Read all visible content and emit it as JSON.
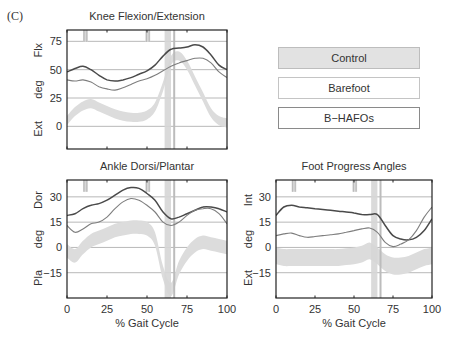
{
  "panel_label": "(C)",
  "legend": {
    "items": [
      {
        "label": "Control",
        "style": "shaded band",
        "color": "#d9d9d9"
      },
      {
        "label": "Barefoot",
        "style": "thin line",
        "color": "#7a7a7a"
      },
      {
        "label": "B−HAFOs",
        "style": "thick line",
        "color": "#444444"
      }
    ]
  },
  "chart_data": [
    {
      "type": "line",
      "title": "Knee Flexion/Extension",
      "xlabel": "",
      "ylabel": [
        "Ext",
        "deg",
        "Flx"
      ],
      "xlim": [
        0,
        100
      ],
      "ylim": [
        -20,
        85
      ],
      "yticks": [
        0,
        25,
        50,
        75
      ],
      "xticks": [
        0,
        25,
        50,
        75,
        100
      ],
      "show_xtick_labels": false,
      "grid": "horizontal",
      "x": [
        0,
        5,
        10,
        15,
        20,
        25,
        30,
        35,
        40,
        45,
        50,
        55,
        60,
        65,
        70,
        75,
        80,
        85,
        90,
        95,
        100
      ],
      "series": [
        {
          "name": "B−HAFOs",
          "values": [
            48,
            51,
            53,
            50,
            45,
            41,
            40,
            41,
            43,
            46,
            49,
            54,
            62,
            68,
            69,
            70,
            72,
            70,
            63,
            54,
            50
          ]
        },
        {
          "name": "Barefoot",
          "values": [
            41,
            40,
            41,
            39,
            35,
            33,
            32,
            34,
            37,
            40,
            42,
            45,
            49,
            53,
            56,
            58,
            60,
            60,
            56,
            48,
            43
          ]
        }
      ],
      "control_band": {
        "mean": [
          5,
          13,
          18,
          20,
          17,
          14,
          11,
          9,
          8,
          8,
          10,
          17,
          35,
          58,
          62,
          54,
          40,
          26,
          12,
          5,
          3
        ],
        "half_width": 4
      },
      "toe_off_band": [
        61,
        65
      ],
      "toe_off_line": 67,
      "event_marks": [
        [
          10,
          13
        ],
        [
          49,
          52
        ]
      ]
    },
    {
      "type": "line",
      "title": "Ankle Dorsi/Plantar",
      "xlabel": "% Gait Cycle",
      "ylabel": [
        "Pla",
        "deg",
        "Dor"
      ],
      "xlim": [
        0,
        100
      ],
      "ylim": [
        -30,
        40
      ],
      "yticks": [
        -15,
        0,
        15,
        30
      ],
      "xticks": [
        0,
        25,
        50,
        75,
        100
      ],
      "show_xtick_labels": true,
      "grid": "horizontal",
      "x": [
        0,
        5,
        10,
        15,
        20,
        25,
        30,
        35,
        40,
        45,
        50,
        55,
        60,
        65,
        70,
        75,
        80,
        85,
        90,
        95,
        100
      ],
      "series": [
        {
          "name": "B−HAFOs",
          "values": [
            19,
            20,
            23,
            25,
            26,
            28,
            31,
            34,
            35.5,
            35,
            32,
            28,
            21,
            17,
            18,
            20,
            22,
            24,
            24,
            23,
            21
          ]
        },
        {
          "name": "Barefoot",
          "values": [
            13,
            9,
            11,
            14,
            15,
            18,
            23,
            27,
            29,
            28,
            25,
            21,
            15,
            13,
            15,
            19,
            22,
            23,
            23,
            20,
            14
          ]
        }
      ],
      "control_band": {
        "mean": [
          -2,
          -5,
          0,
          4,
          6,
          8,
          10,
          11,
          12,
          12,
          11,
          5,
          -15,
          -25,
          -12,
          -4,
          1,
          3,
          2,
          1,
          0
        ],
        "half_width": 4
      },
      "toe_off_band": [
        61,
        65
      ],
      "toe_off_line": 67,
      "event_marks": [
        [
          10,
          13
        ],
        [
          49,
          52
        ]
      ]
    },
    {
      "type": "line",
      "title": "Foot Progress Angles",
      "xlabel": "% Gait Cycle",
      "ylabel": [
        "Ext",
        "deg",
        "Int"
      ],
      "xlim": [
        0,
        100
      ],
      "ylim": [
        -30,
        40
      ],
      "yticks": [
        -15,
        0,
        15,
        30
      ],
      "xticks": [
        0,
        25,
        50,
        75,
        100
      ],
      "show_xtick_labels": true,
      "grid": "horizontal",
      "x": [
        0,
        5,
        10,
        15,
        20,
        25,
        30,
        35,
        40,
        45,
        50,
        55,
        60,
        65,
        70,
        75,
        80,
        85,
        90,
        95,
        100
      ],
      "series": [
        {
          "name": "B−HAFOs",
          "values": [
            19,
            24,
            25,
            24,
            23.5,
            23,
            22.5,
            22,
            21.5,
            21,
            20.5,
            19.5,
            19.5,
            19.5,
            13,
            7,
            5,
            4.5,
            6,
            10,
            17
          ]
        },
        {
          "name": "Barefoot",
          "values": [
            7,
            8,
            8.5,
            7,
            6,
            6.5,
            7,
            7.5,
            8,
            9,
            10,
            11,
            11.5,
            9,
            3,
            0.5,
            2,
            4.5,
            10,
            18,
            24
          ]
        }
      ],
      "control_band": {
        "mean": [
          -5,
          -6,
          -6,
          -6,
          -6,
          -6,
          -6,
          -6,
          -6,
          -5.5,
          -5,
          -4,
          -2,
          -5,
          -9,
          -11,
          -11,
          -10,
          -8,
          -6,
          -5
        ],
        "half_width": 5
      },
      "toe_off_band": [
        61,
        65
      ],
      "toe_off_line": 67,
      "event_marks": [
        [
          10,
          13
        ],
        [
          49,
          52
        ]
      ]
    }
  ],
  "layout": {
    "plots": [
      {
        "left": 67,
        "top": 30,
        "right": 227,
        "bottom": 149,
        "title_y": 20,
        "ylabel_x": 42
      },
      {
        "left": 67,
        "top": 180,
        "right": 227,
        "bottom": 298,
        "title_y": 170,
        "ylabel_x": 42
      },
      {
        "left": 276,
        "top": 180,
        "right": 432,
        "bottom": 298,
        "title_y": 170,
        "ylabel_x": 252
      }
    ]
  }
}
